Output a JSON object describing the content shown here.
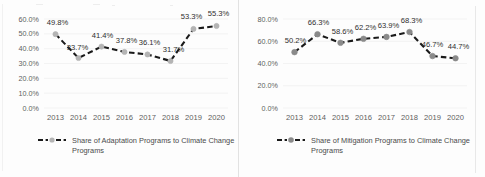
{
  "chart_data": [
    {
      "type": "line",
      "title": "",
      "xlabel": "",
      "ylabel": "",
      "categories": [
        "2013",
        "2014",
        "2015",
        "2016",
        "2017",
        "2018",
        "2019",
        "2020"
      ],
      "values": [
        49.8,
        33.7,
        41.4,
        37.8,
        36.1,
        31.7,
        53.3,
        55.3
      ],
      "data_labels": [
        "49.8%",
        "33.7%",
        "41.4%",
        "37.8%",
        "36.1%",
        "31.7%",
        "53.3%",
        "55.3%"
      ],
      "ylim": [
        0,
        60
      ],
      "ytick_labels": [
        "0.0%",
        "10.0%",
        "20.0%",
        "30.0%",
        "40.0%",
        "50.0%",
        "60.0%"
      ],
      "ytick_values": [
        0,
        10,
        20,
        30,
        40,
        50,
        60
      ],
      "grid": true,
      "legend_position": "bottom",
      "legend": [
        "Share of Adaptation Programs to Climate Change Programs"
      ],
      "series_name": "Share of Adaptation Programs to Climate Change Programs",
      "line_color": "#1a1a1a",
      "marker_color": "#b4b4b4",
      "line_style": "dashed"
    },
    {
      "type": "line",
      "title": "",
      "xlabel": "",
      "ylabel": "",
      "categories": [
        "2013",
        "2014",
        "2015",
        "2016",
        "2017",
        "2018",
        "2019",
        "2020"
      ],
      "values": [
        50.2,
        66.3,
        58.6,
        62.2,
        63.9,
        68.3,
        46.7,
        44.7
      ],
      "data_labels": [
        "50.2%",
        "66.3%",
        "58.6%",
        "62.2%",
        "63.9%",
        "68.3%",
        "46.7%",
        "44.7%"
      ],
      "ylim": [
        0,
        80
      ],
      "ytick_labels": [
        "0.0%",
        "20.0%",
        "40.0%",
        "60.0%",
        "80.0%"
      ],
      "ytick_values": [
        0,
        20,
        40,
        60,
        80
      ],
      "grid": true,
      "legend_position": "bottom",
      "legend": [
        "Share of Mitigation Programs to Climate Change Programs"
      ],
      "series_name": "Share of Mitigation Programs to Climate Change Programs",
      "line_color": "#1a1a1a",
      "marker_color": "#8a8a8a",
      "line_style": "dashed"
    }
  ]
}
